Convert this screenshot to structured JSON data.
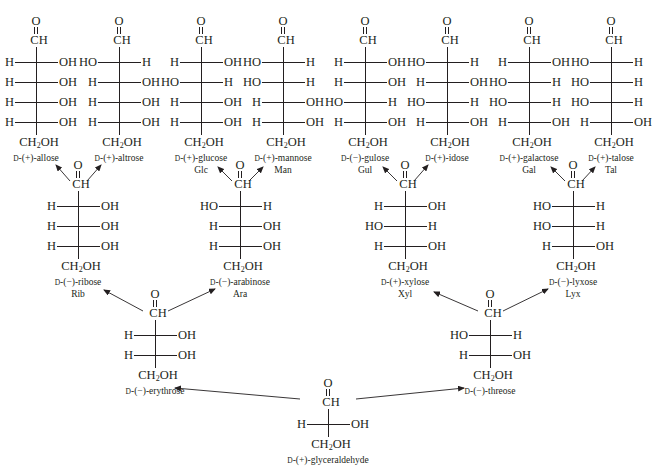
{
  "diagram": {
    "title": "",
    "subtitle": ""
  },
  "molecules": [
    {
      "id": "allose",
      "cx": 36,
      "top": 14,
      "rows": [
        [
          "H",
          "OH"
        ],
        [
          "H",
          "OH"
        ],
        [
          "H",
          "OH"
        ],
        [
          "H",
          "OH"
        ]
      ],
      "prefix": "D",
      "sign": "(+)",
      "name": "-allose",
      "abbr": ""
    },
    {
      "id": "altrose",
      "cx": 119,
      "top": 14,
      "rows": [
        [
          "HO",
          "H"
        ],
        [
          "H",
          "OH"
        ],
        [
          "H",
          "OH"
        ],
        [
          "H",
          "OH"
        ]
      ],
      "prefix": "D",
      "sign": "(+)",
      "name": "-altrose",
      "abbr": ""
    },
    {
      "id": "glucose",
      "cx": 201,
      "top": 14,
      "rows": [
        [
          "H",
          "OH"
        ],
        [
          "HO",
          "H"
        ],
        [
          "H",
          "OH"
        ],
        [
          "H",
          "OH"
        ]
      ],
      "prefix": "D",
      "sign": "(+)",
      "name": "-glucose",
      "abbr": "Glc"
    },
    {
      "id": "mannose",
      "cx": 283,
      "top": 14,
      "rows": [
        [
          "HO",
          "H"
        ],
        [
          "HO",
          "H"
        ],
        [
          "H",
          "OH"
        ],
        [
          "H",
          "OH"
        ]
      ],
      "prefix": "D",
      "sign": "(+)",
      "name": "-mannose",
      "abbr": "Man"
    },
    {
      "id": "gulose",
      "cx": 365,
      "top": 14,
      "rows": [
        [
          "H",
          "OH"
        ],
        [
          "H",
          "OH"
        ],
        [
          "HO",
          "H"
        ],
        [
          "H",
          "OH"
        ]
      ],
      "prefix": "D",
      "sign": "(−)",
      "name": "-gulose",
      "abbr": "Gul"
    },
    {
      "id": "idose",
      "cx": 447,
      "top": 14,
      "rows": [
        [
          "HO",
          "H"
        ],
        [
          "H",
          "OH"
        ],
        [
          "HO",
          "H"
        ],
        [
          "H",
          "OH"
        ]
      ],
      "prefix": "D",
      "sign": "(+)",
      "name": "-idose",
      "abbr": ""
    },
    {
      "id": "galactose",
      "cx": 529,
      "top": 14,
      "rows": [
        [
          "H",
          "OH"
        ],
        [
          "HO",
          "H"
        ],
        [
          "HO",
          "H"
        ],
        [
          "H",
          "OH"
        ]
      ],
      "prefix": "D",
      "sign": "(+)",
      "name": "-galactose",
      "abbr": "Gal"
    },
    {
      "id": "talose",
      "cx": 611,
      "top": 14,
      "rows": [
        [
          "HO",
          "H"
        ],
        [
          "HO",
          "H"
        ],
        [
          "HO",
          "H"
        ],
        [
          "H",
          "OH"
        ]
      ],
      "prefix": "D",
      "sign": "(+)",
      "name": "-talose",
      "abbr": "Tal"
    },
    {
      "id": "ribose",
      "cx": 78,
      "top": 158,
      "rows": [
        [
          "H",
          "OH"
        ],
        [
          "H",
          "OH"
        ],
        [
          "H",
          "OH"
        ]
      ],
      "prefix": "D",
      "sign": "(−)",
      "name": "-ribose",
      "abbr": "Rib"
    },
    {
      "id": "arabinose",
      "cx": 240,
      "top": 158,
      "rows": [
        [
          "HO",
          "H"
        ],
        [
          "H",
          "OH"
        ],
        [
          "H",
          "OH"
        ]
      ],
      "prefix": "D",
      "sign": "(−)",
      "name": "-arabinose",
      "abbr": "Ara"
    },
    {
      "id": "xylose",
      "cx": 405,
      "top": 158,
      "rows": [
        [
          "H",
          "OH"
        ],
        [
          "HO",
          "H"
        ],
        [
          "H",
          "OH"
        ]
      ],
      "prefix": "D",
      "sign": "(+)",
      "name": "-xylose",
      "abbr": "Xyl"
    },
    {
      "id": "lyxose",
      "cx": 573,
      "top": 158,
      "rows": [
        [
          "HO",
          "H"
        ],
        [
          "HO",
          "H"
        ],
        [
          "H",
          "OH"
        ]
      ],
      "prefix": "D",
      "sign": "(−)",
      "name": "-lyxose",
      "abbr": "Lyx"
    },
    {
      "id": "erythrose",
      "cx": 155,
      "top": 287,
      "rows": [
        [
          "H",
          "OH"
        ],
        [
          "H",
          "OH"
        ]
      ],
      "prefix": "D",
      "sign": "(−)",
      "name": "-erythrose",
      "abbr": ""
    },
    {
      "id": "threose",
      "cx": 490,
      "top": 287,
      "rows": [
        [
          "HO",
          "H"
        ],
        [
          "H",
          "OH"
        ]
      ],
      "prefix": "D",
      "sign": "(−)",
      "name": "-threose",
      "abbr": ""
    },
    {
      "id": "glyceraldehyde",
      "cx": 328,
      "top": 376,
      "rows": [
        [
          "H",
          "OH"
        ]
      ],
      "prefix": "D",
      "sign": "(+)",
      "name": "-glyceraldehyde",
      "abbr": ""
    }
  ],
  "labels": {
    "carbonyl_o": "O",
    "aldehyde": "CH",
    "terminal_a": "CH",
    "terminal_sub": "2",
    "terminal_b": "OH"
  },
  "arrows": [
    {
      "from": "glyceraldehyde",
      "to": "erythrose",
      "x1": 300,
      "y1": 399,
      "x2": 175,
      "y2": 388
    },
    {
      "from": "glyceraldehyde",
      "to": "threose",
      "x1": 356,
      "y1": 399,
      "x2": 464,
      "y2": 388
    },
    {
      "from": "erythrose",
      "to": "ribose",
      "x1": 143,
      "y1": 311,
      "x2": 104,
      "y2": 290
    },
    {
      "from": "erythrose",
      "to": "arabinose",
      "x1": 168,
      "y1": 311,
      "x2": 215,
      "y2": 289
    },
    {
      "from": "threose",
      "to": "xylose",
      "x1": 478,
      "y1": 311,
      "x2": 434,
      "y2": 292
    },
    {
      "from": "threose",
      "to": "lyxose",
      "x1": 503,
      "y1": 311,
      "x2": 548,
      "y2": 289
    },
    {
      "from": "ribose",
      "to": "allose",
      "x1": 70,
      "y1": 181,
      "x2": 56,
      "y2": 165
    },
    {
      "from": "ribose",
      "to": "altrose",
      "x1": 87,
      "y1": 181,
      "x2": 101,
      "y2": 165
    },
    {
      "from": "arabinose",
      "to": "glucose",
      "x1": 232,
      "y1": 181,
      "x2": 218,
      "y2": 167
    },
    {
      "from": "arabinose",
      "to": "mannose",
      "x1": 249,
      "y1": 181,
      "x2": 263,
      "y2": 167
    },
    {
      "from": "xylose",
      "to": "gulose",
      "x1": 397,
      "y1": 181,
      "x2": 383,
      "y2": 167
    },
    {
      "from": "xylose",
      "to": "idose",
      "x1": 414,
      "y1": 181,
      "x2": 428,
      "y2": 165
    },
    {
      "from": "lyxose",
      "to": "galactose",
      "x1": 565,
      "y1": 181,
      "x2": 551,
      "y2": 167
    },
    {
      "from": "lyxose",
      "to": "talose",
      "x1": 582,
      "y1": 181,
      "x2": 595,
      "y2": 167
    }
  ],
  "colors": {
    "ink": "#231f20",
    "background": "#ffffff"
  }
}
